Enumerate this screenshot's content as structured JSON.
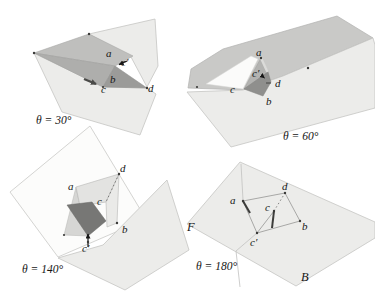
{
  "figure": {
    "colors": {
      "plane_light": "#ececea",
      "plane_gray": "#c9c9c7",
      "plane_white": "#fcfcfb",
      "flap_medium": "#bfbfbd",
      "under_medium": "#aeaeac",
      "shadow_dark": "#9b9b99",
      "face_dark": "#777775",
      "label_color": "#161616"
    },
    "panels": [
      {
        "id": "theta-30",
        "theta": "θ = 30°",
        "points": {
          "a": "a",
          "b": "b",
          "c": "c",
          "c_prime": "c′",
          "d": "d"
        }
      },
      {
        "id": "theta-60",
        "theta": "θ = 60°",
        "points": {
          "a": "a",
          "b": "b",
          "c": "c",
          "c_prime": "c′",
          "d": "d"
        }
      },
      {
        "id": "theta-140",
        "theta": "θ = 140°",
        "points": {
          "a": "a",
          "b": "b",
          "c": "c",
          "c_prime": "c′",
          "d": "d"
        }
      },
      {
        "id": "theta-180",
        "theta": "θ = 180°",
        "points": {
          "a": "a",
          "b": "b",
          "c": "c",
          "c_prime": "c′",
          "d": "d"
        },
        "regions": {
          "front": "F",
          "back": "B"
        }
      }
    ]
  }
}
